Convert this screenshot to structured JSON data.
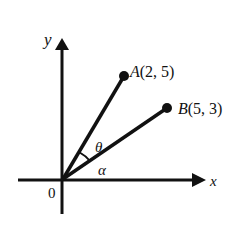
{
  "diagram": {
    "type": "vector-angle",
    "axes": {
      "x_label": "x",
      "y_label": "y",
      "origin_label": "0"
    },
    "points": [
      {
        "id": "A",
        "label": "A(2, 5)",
        "x": 2,
        "y": 5
      },
      {
        "id": "B",
        "label": "B(5, 3)",
        "x": 5,
        "y": 3
      }
    ],
    "angles": [
      {
        "symbol": "θ",
        "between": [
          "OA",
          "OB"
        ]
      },
      {
        "symbol": "α",
        "between": [
          "x-axis",
          "OB"
        ]
      }
    ],
    "colors": {
      "stroke": "#111111",
      "background": "#ffffff"
    }
  }
}
